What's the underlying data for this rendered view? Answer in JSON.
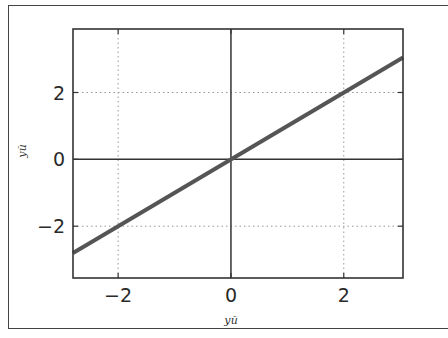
{
  "chart_data": {
    "type": "line",
    "title": "",
    "xlabel": "уй",
    "ylabel": "уй",
    "xlim": [
      -2.8,
      3.05
    ],
    "ylim": [
      -3.55,
      3.9
    ],
    "xticks": [
      -2,
      0,
      2
    ],
    "yticks": [
      -2,
      0,
      2
    ],
    "xtick_labels": [
      "−2",
      "0",
      "2"
    ],
    "ytick_labels": [
      "−2",
      "0",
      "2"
    ],
    "grid": true,
    "grid_style": "dotted",
    "zero_lines": true,
    "series": [
      {
        "name": "y = x",
        "color": "#555555",
        "x": [
          -2.8,
          3.05
        ],
        "y": [
          -2.8,
          3.05
        ]
      }
    ],
    "legend": null
  },
  "labels": {
    "x_axis": "уй",
    "y_axis": "уй"
  }
}
